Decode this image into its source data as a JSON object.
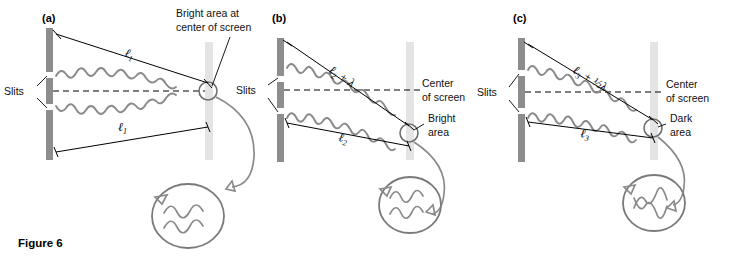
{
  "figure": {
    "caption": "Figure 6",
    "panels": [
      {
        "letter": "(a)",
        "slits_label": "Slits",
        "upper_path_label": "ℓ",
        "upper_path_sub": "1",
        "upper_path_extra": "",
        "lower_path_label": "ℓ",
        "lower_path_sub": "1",
        "result_label_line1": "Bright area at",
        "result_label_line2": "center of screen",
        "center_label_line1": "",
        "center_label_line2": "",
        "interference": "constructive"
      },
      {
        "letter": "(b)",
        "slits_label": "Slits",
        "upper_path_label": "ℓ",
        "upper_path_sub": "2",
        "upper_path_extra": " + λ",
        "lower_path_label": "ℓ",
        "lower_path_sub": "2",
        "result_label_line1": "Bright",
        "result_label_line2": "area",
        "center_label_line1": "Center",
        "center_label_line2": "of screen",
        "interference": "constructive"
      },
      {
        "letter": "(c)",
        "slits_label": "Slits",
        "upper_path_label": "ℓ",
        "upper_path_sub": "3",
        "upper_path_extra": " + ½λ",
        "lower_path_label": "ℓ",
        "lower_path_sub": "3",
        "result_label_line1": "Dark",
        "result_label_line2": "area",
        "center_label_line1": "Center",
        "center_label_line2": "of screen",
        "interference": "destructive"
      }
    ],
    "colors": {
      "barrier": "#8d8d8d",
      "screen": "#e4e4e4",
      "wave": "#8a8a8a",
      "line": "#000000",
      "text": "#111111"
    }
  }
}
